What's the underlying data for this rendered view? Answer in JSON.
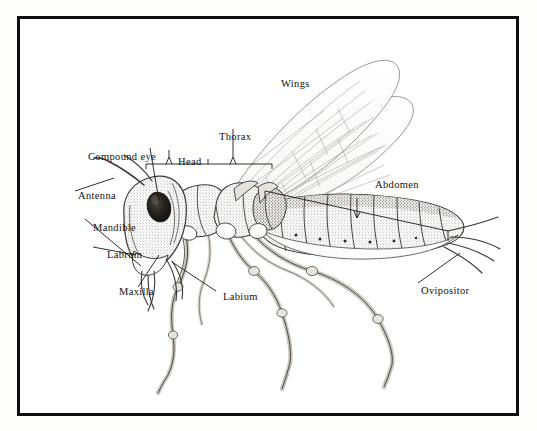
{
  "figure": {
    "kind": "scientific-illustration",
    "style": "engraving / stipple line drawing",
    "background_color": "#ffffff",
    "ink_color": "#12110f",
    "frame": {
      "border_color": "#0d0d0d",
      "border_width_px": 3
    }
  },
  "labels": {
    "compound_eye": "Compound eye",
    "head": "Head",
    "thorax": "Thorax",
    "wings": "Wings",
    "abdomen": "Abdomen",
    "antenna": "Antenna",
    "mandible": "Mandible",
    "labrum": "Labrum",
    "maxilla": "Maxilla",
    "labium": "Labium",
    "ovipositor": "Ovipositor"
  },
  "label_list": [
    {
      "id": "compound-eye",
      "text": "Compound eye",
      "leader": "line",
      "side": "left"
    },
    {
      "id": "head",
      "text": "Head",
      "leader": "brace",
      "side": "top"
    },
    {
      "id": "thorax",
      "text": "Thorax",
      "leader": "brace",
      "side": "top"
    },
    {
      "id": "wings",
      "text": "Wings",
      "leader": "none",
      "side": "top"
    },
    {
      "id": "abdomen",
      "text": "Abdomen",
      "leader": "brace",
      "side": "right"
    },
    {
      "id": "antenna",
      "text": "Antenna",
      "leader": "line",
      "side": "left"
    },
    {
      "id": "mandible",
      "text": "Mandible",
      "leader": "line",
      "side": "left"
    },
    {
      "id": "labrum",
      "text": "Labrum",
      "leader": "line",
      "side": "left"
    },
    {
      "id": "maxilla",
      "text": "Maxilla",
      "leader": "line",
      "side": "left"
    },
    {
      "id": "labium",
      "text": "Labium",
      "leader": "line",
      "side": "bottom"
    },
    {
      "id": "ovipositor",
      "text": "Ovipositor",
      "leader": "line",
      "side": "right"
    }
  ],
  "anatomy_parts": [
    "antenna",
    "compound eye",
    "head",
    "mandible",
    "labrum",
    "maxilla",
    "labium",
    "thorax",
    "wings",
    "legs",
    "abdomen",
    "ovipositor"
  ]
}
